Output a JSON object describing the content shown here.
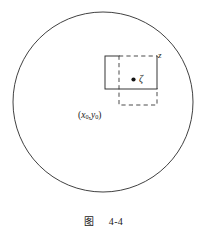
{
  "figure": {
    "caption_prefix": "图",
    "caption_number": "4-4",
    "caption_full": "图 4-4"
  },
  "labels": {
    "outer_variable": "z",
    "inner_point": "ζ",
    "corner_point_open": "(",
    "corner_point_x": "x",
    "corner_point_x_sub": "0",
    "corner_point_comma": ",",
    "corner_point_y": "y",
    "corner_point_y_sub": "0",
    "corner_point_close": ")",
    "corner_point_full": "(x0,y0)"
  },
  "icons": {
    "filled_dot": "filled-dot-icon",
    "circle_boundary": "circle-outline-icon",
    "dashed_square": "dashed-square-icon",
    "solid_region": "solid-rectangle-icon"
  },
  "geometry": {
    "circle": {
      "cx": 103,
      "cy": 102,
      "r": 90
    },
    "dashed_square": {
      "x": 119,
      "y": 56,
      "w": 38,
      "h": 49
    },
    "solid_rect": {
      "x": 105,
      "y": 56,
      "w": 52,
      "h": 33
    },
    "dot": {
      "cx": 133.5,
      "cy": 79.5,
      "r": 2.1
    }
  },
  "colors": {
    "stroke": "#2b2b2b",
    "background": "#ffffff",
    "text": "#1a1a1a"
  }
}
